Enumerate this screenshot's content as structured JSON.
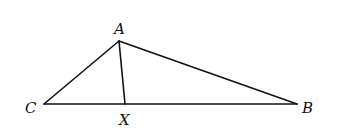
{
  "diagram": {
    "type": "triangle with cevian",
    "points": {
      "A": {
        "label": "A",
        "x": 119,
        "y": 41,
        "lx": 114,
        "ly": 34
      },
      "B": {
        "label": "B",
        "x": 297,
        "y": 104,
        "lx": 302,
        "ly": 113
      },
      "C": {
        "label": "C",
        "x": 44,
        "y": 104,
        "lx": 25,
        "ly": 113
      },
      "X": {
        "label": "X",
        "x": 125,
        "y": 104,
        "lx": 119,
        "ly": 125
      }
    },
    "segments": [
      {
        "from": "A",
        "to": "B"
      },
      {
        "from": "A",
        "to": "C"
      },
      {
        "from": "C",
        "to": "B"
      },
      {
        "from": "A",
        "to": "X"
      }
    ]
  }
}
